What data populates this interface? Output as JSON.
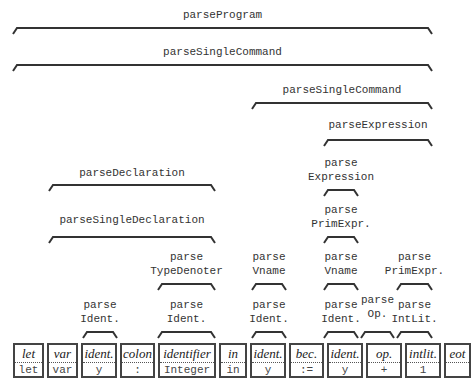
{
  "parsers": [
    {
      "id": "p0",
      "label": "parseProgram",
      "x1": 13,
      "x2": 432,
      "y": 28,
      "labelY": 8
    },
    {
      "id": "p1",
      "label": "parseSingleCommand",
      "x1": 13,
      "x2": 432,
      "y": 65,
      "labelY": 45
    },
    {
      "id": "p2",
      "label": "parseSingleCommand",
      "x1": 252,
      "x2": 432,
      "y": 103,
      "labelY": 83
    },
    {
      "id": "p3",
      "label": "parseExpression",
      "x1": 324,
      "x2": 432,
      "y": 140,
      "labelY": 118
    },
    {
      "id": "p4",
      "label": "parseDeclaration",
      "x1": 49,
      "x2": 215,
      "y": 185,
      "labelY": 166
    },
    {
      "id": "p5",
      "label": "parse\nExpression",
      "x1": 324,
      "x2": 358,
      "y": 190,
      "labelY": 156
    },
    {
      "id": "p6",
      "label": "parseSingleDeclaration",
      "x1": 49,
      "x2": 215,
      "y": 237,
      "labelY": 213
    },
    {
      "id": "p7",
      "label": "parse\nPrimExpr.",
      "x1": 324,
      "x2": 358,
      "y": 237,
      "labelY": 203
    },
    {
      "id": "p8",
      "label": "parse\nTypeDenoter",
      "x1": 158,
      "x2": 215,
      "y": 284,
      "labelY": 250
    },
    {
      "id": "p9",
      "label": "parse\nVname",
      "x1": 252,
      "x2": 286,
      "y": 284,
      "labelY": 250
    },
    {
      "id": "p10",
      "label": "parse\nVname",
      "x1": 324,
      "x2": 358,
      "y": 284,
      "labelY": 250
    },
    {
      "id": "p11",
      "label": "parse\nPrimExpr.",
      "x1": 397,
      "x2": 432,
      "y": 284,
      "labelY": 250
    },
    {
      "id": "p12",
      "label": "parse\nIdent.",
      "x1": 83,
      "x2": 117,
      "y": 332,
      "labelY": 298
    },
    {
      "id": "p13",
      "label": "parse\nIdent.",
      "x1": 158,
      "x2": 215,
      "y": 332,
      "labelY": 298
    },
    {
      "id": "p14",
      "label": "parse\nIdent.",
      "x1": 252,
      "x2": 286,
      "y": 332,
      "labelY": 298
    },
    {
      "id": "p15",
      "label": "parse\nIdent.",
      "x1": 324,
      "x2": 358,
      "y": 332,
      "labelY": 298
    },
    {
      "id": "p16",
      "label": "parse\nOp.",
      "x1": 361,
      "x2": 394,
      "y": 332,
      "labelY": 293
    },
    {
      "id": "p17",
      "label": "parse\nIntLit.",
      "x1": 397,
      "x2": 432,
      "y": 332,
      "labelY": 298
    }
  ],
  "tokens": [
    {
      "kind": "let",
      "spelling": "let",
      "x": 13,
      "w": 31
    },
    {
      "kind": "var",
      "spelling": "var",
      "x": 47,
      "w": 31
    },
    {
      "kind": "ident.",
      "spelling": "y",
      "x": 81,
      "w": 36
    },
    {
      "kind": "colon",
      "spelling": ":",
      "x": 120,
      "w": 35
    },
    {
      "kind": "identifier",
      "spelling": "Integer",
      "x": 158,
      "w": 58
    },
    {
      "kind": "in",
      "spelling": "in",
      "x": 219,
      "w": 28
    },
    {
      "kind": "ident.",
      "spelling": "y",
      "x": 250,
      "w": 36
    },
    {
      "kind": "bec.",
      "spelling": ":=",
      "x": 289,
      "w": 35
    },
    {
      "kind": "ident.",
      "spelling": "y",
      "x": 327,
      "w": 36
    },
    {
      "kind": "op.",
      "spelling": "+",
      "x": 366,
      "w": 36
    },
    {
      "kind": "intlit.",
      "spelling": "1",
      "x": 405,
      "w": 36
    },
    {
      "kind": "eot",
      "spelling": "",
      "x": 444,
      "w": 27
    }
  ],
  "colors": {
    "line": "#333333",
    "text": "#333333",
    "box_border": "#444444"
  }
}
